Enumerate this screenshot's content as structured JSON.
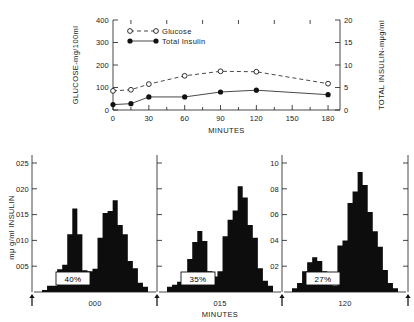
{
  "figure": {
    "top_panel": {
      "left_axis_title": "GLUCOSE-mg/100ml",
      "right_axis_title": "TOTAL INSULIN-mμg/ml",
      "x_axis_title": "MINUTES",
      "left_ticks": [
        "0",
        "100",
        "200",
        "300",
        "400"
      ],
      "right_ticks": [
        "0",
        "5",
        "10",
        "15",
        "20"
      ],
      "x_ticks": [
        "0",
        "30",
        "60",
        "90",
        "120",
        "150",
        "180"
      ],
      "legend": [
        {
          "label": "Glucose",
          "marker": "open-circle",
          "line": "dashed"
        },
        {
          "label": "Total Insulin",
          "marker": "filled-circle",
          "line": "solid"
        }
      ]
    },
    "bottom_panels": {
      "y_axis_title": "mμ g/ml  INSULIN",
      "x_axis_title": "MINUTES",
      "left_ticks": [
        "005",
        "010",
        "015",
        "020",
        "025"
      ],
      "right_ticks": [
        "02",
        "04",
        "06",
        "08",
        "10"
      ],
      "panels": [
        {
          "time_label": "000",
          "percent_label": "40%"
        },
        {
          "time_label": "015",
          "percent_label": "35%"
        },
        {
          "time_label": "120",
          "percent_label": "27%"
        }
      ]
    }
  },
  "chart_data": [
    {
      "type": "line",
      "title": "",
      "xlabel": "MINUTES",
      "ylabel": "GLUCOSE-mg/100ml",
      "y2label": "TOTAL INSULIN-mμg/ml",
      "x": [
        0,
        15,
        30,
        60,
        90,
        120,
        180
      ],
      "xlim": [
        0,
        190
      ],
      "ylim": [
        0,
        400
      ],
      "y2lim": [
        0,
        20
      ],
      "xticks": [
        0,
        30,
        60,
        90,
        120,
        150,
        180
      ],
      "yticks": [
        0,
        100,
        200,
        300,
        400
      ],
      "y2ticks": [
        0,
        5,
        10,
        15,
        20
      ],
      "grid": false,
      "legend_position": "upper-left",
      "series": [
        {
          "name": "Glucose",
          "axis": "left",
          "marker": "open-circle",
          "linestyle": "dashed",
          "values": [
            85,
            90,
            115,
            152,
            172,
            170,
            117
          ]
        },
        {
          "name": "Total Insulin",
          "axis": "right",
          "marker": "filled-circle",
          "linestyle": "solid",
          "values": [
            1.2,
            1.4,
            2.9,
            2.9,
            4.0,
            4.4,
            3.4
          ]
        }
      ]
    },
    {
      "type": "bar",
      "title": "000",
      "annotation": "40%",
      "xlabel": "MINUTES",
      "ylabel": "mμg/ml  INSULIN",
      "ylim": [
        0,
        0.25
      ],
      "yticks": [
        0.05,
        0.1,
        0.15,
        0.2,
        0.25
      ],
      "grid": false,
      "categories": [
        "1",
        "2",
        "3",
        "4",
        "5",
        "6",
        "7",
        "8",
        "9",
        "10",
        "11",
        "12",
        "13",
        "14",
        "15",
        "16",
        "17",
        "18",
        "19",
        "20",
        "21"
      ],
      "values": [
        0.004,
        0.012,
        0.012,
        0.044,
        0.053,
        0.112,
        0.162,
        0.112,
        0.042,
        0.04,
        0.045,
        0.105,
        0.153,
        0.157,
        0.178,
        0.13,
        0.112,
        0.06,
        0.046,
        0.018,
        0.01
      ]
    },
    {
      "type": "bar",
      "title": "015",
      "annotation": "35%",
      "xlabel": "MINUTES",
      "ylabel": "mμg/ml  INSULIN",
      "ylim": [
        0,
        0.25
      ],
      "yticks": [
        0.05,
        0.1,
        0.15,
        0.2,
        0.25
      ],
      "grid": false,
      "categories": [
        "1",
        "2",
        "3",
        "4",
        "5",
        "6",
        "7",
        "8",
        "9",
        "10",
        "11",
        "12",
        "13",
        "14",
        "15",
        "16",
        "17",
        "18",
        "19",
        "20",
        "21"
      ],
      "values": [
        0.01,
        0.014,
        0.02,
        0.03,
        0.064,
        0.097,
        0.118,
        0.099,
        0.04,
        0.03,
        0.04,
        0.108,
        0.14,
        0.158,
        0.205,
        0.183,
        0.13,
        0.105,
        0.046,
        0.022,
        0.012
      ]
    },
    {
      "type": "bar",
      "title": "120",
      "annotation": "27%",
      "xlabel": "MINUTES",
      "ylabel": "mμg/ml  INSULIN",
      "ylim": [
        0,
        1.0
      ],
      "yticks": [
        0.2,
        0.4,
        0.6,
        0.8,
        1.0
      ],
      "grid": false,
      "categories": [
        "1",
        "2",
        "3",
        "4",
        "5",
        "6",
        "7",
        "8",
        "9",
        "10",
        "11",
        "12",
        "13",
        "14",
        "15",
        "16",
        "17",
        "18",
        "19",
        "20",
        "21"
      ],
      "values": [
        0.03,
        0.07,
        0.16,
        0.23,
        0.27,
        0.24,
        0.16,
        0.06,
        0.05,
        0.36,
        0.4,
        0.69,
        0.78,
        0.93,
        0.83,
        0.62,
        0.47,
        0.35,
        0.17,
        0.07,
        0.03
      ]
    }
  ]
}
